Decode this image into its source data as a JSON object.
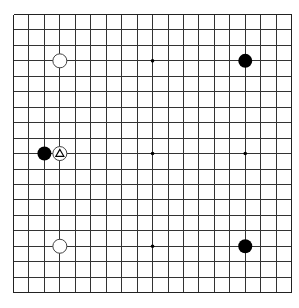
{
  "board": {
    "size": 19,
    "origin_x": 13.5,
    "origin_y": 14.5,
    "spacing": 15.45,
    "stone_radius": 7,
    "line_color": "#333333",
    "background": "#ffffff",
    "star_points": [
      [
        3,
        3
      ],
      [
        9,
        3
      ],
      [
        15,
        3
      ],
      [
        3,
        9
      ],
      [
        9,
        9
      ],
      [
        15,
        9
      ],
      [
        3,
        15
      ],
      [
        9,
        15
      ],
      [
        15,
        15
      ]
    ],
    "stones": [
      {
        "color": "white",
        "col": 3,
        "row": 3
      },
      {
        "color": "black",
        "col": 15,
        "row": 3
      },
      {
        "color": "black",
        "col": 2,
        "row": 9
      },
      {
        "color": "white",
        "col": 3,
        "row": 9,
        "marker": "triangle"
      },
      {
        "color": "white",
        "col": 3,
        "row": 15
      },
      {
        "color": "black",
        "col": 15,
        "row": 15
      }
    ],
    "colors": {
      "black_stone": "#000000",
      "white_stone_fill": "#ffffff",
      "white_stone_stroke": "#444444",
      "marker_stroke": "#000000"
    }
  }
}
